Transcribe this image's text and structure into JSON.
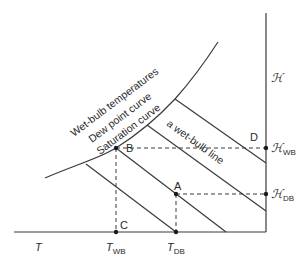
{
  "diagram": {
    "title": "",
    "colors": {
      "line": "#3a3a3a",
      "dashed": "#3a3a3a",
      "dot": "#1a1a1a",
      "text": "#2a2a2a"
    },
    "curve_labels": {
      "line1": "Wet-bulb temperatures",
      "line2": "Dew point curve",
      "line3": "Saturation curve"
    },
    "wet_bulb_line_label": "a wet-bulb line",
    "points": {
      "A": "A",
      "B": "B",
      "C": "C",
      "D": "D"
    },
    "axes": {
      "x_label": "T",
      "y_label": "ℋ",
      "t_wb": {
        "main": "T",
        "sub": "WB"
      },
      "t_db": {
        "main": "T",
        "sub": "DB"
      },
      "h_wb": {
        "main": "ℋ",
        "sub": "WB"
      },
      "h_db": {
        "main": "ℋ",
        "sub": "DB"
      }
    }
  }
}
